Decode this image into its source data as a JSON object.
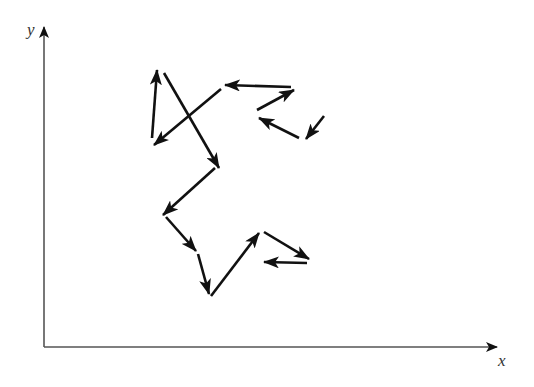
{
  "diagram": {
    "title": "",
    "type": "random-walk vector diagram",
    "axes": {
      "x_label": "x",
      "y_label": "y",
      "origin": [
        44,
        347
      ],
      "x_end": [
        497,
        347
      ],
      "y_end": [
        44,
        27
      ],
      "color": "#555555"
    },
    "arrow_color": "#111111",
    "arrows": [
      {
        "id": 1,
        "from": [
          152,
          138
        ],
        "to": [
          157,
          70
        ]
      },
      {
        "id": 2,
        "from": [
          164,
          73
        ],
        "to": [
          219,
          168
        ]
      },
      {
        "id": 3,
        "from": [
          221,
          89
        ],
        "to": [
          154,
          145
        ]
      },
      {
        "id": 4,
        "from": [
          291,
          87
        ],
        "to": [
          225,
          85
        ]
      },
      {
        "id": 5,
        "from": [
          257,
          110
        ],
        "to": [
          294,
          90
        ]
      },
      {
        "id": 6,
        "from": [
          299,
          138
        ],
        "to": [
          259,
          118
        ]
      },
      {
        "id": 7,
        "from": [
          324,
          116
        ],
        "to": [
          306,
          139
        ]
      },
      {
        "id": 8,
        "from": [
          215,
          168
        ],
        "to": [
          163,
          215
        ]
      },
      {
        "id": 9,
        "from": [
          166,
          217
        ],
        "to": [
          196,
          251
        ]
      },
      {
        "id": 10,
        "from": [
          198,
          254
        ],
        "to": [
          209,
          294
        ]
      },
      {
        "id": 11,
        "from": [
          211,
          296
        ],
        "to": [
          259,
          233
        ]
      },
      {
        "id": 12,
        "from": [
          264,
          232
        ],
        "to": [
          309,
          259
        ]
      },
      {
        "id": 13,
        "from": [
          307,
          263
        ],
        "to": [
          264,
          262
        ]
      }
    ]
  }
}
